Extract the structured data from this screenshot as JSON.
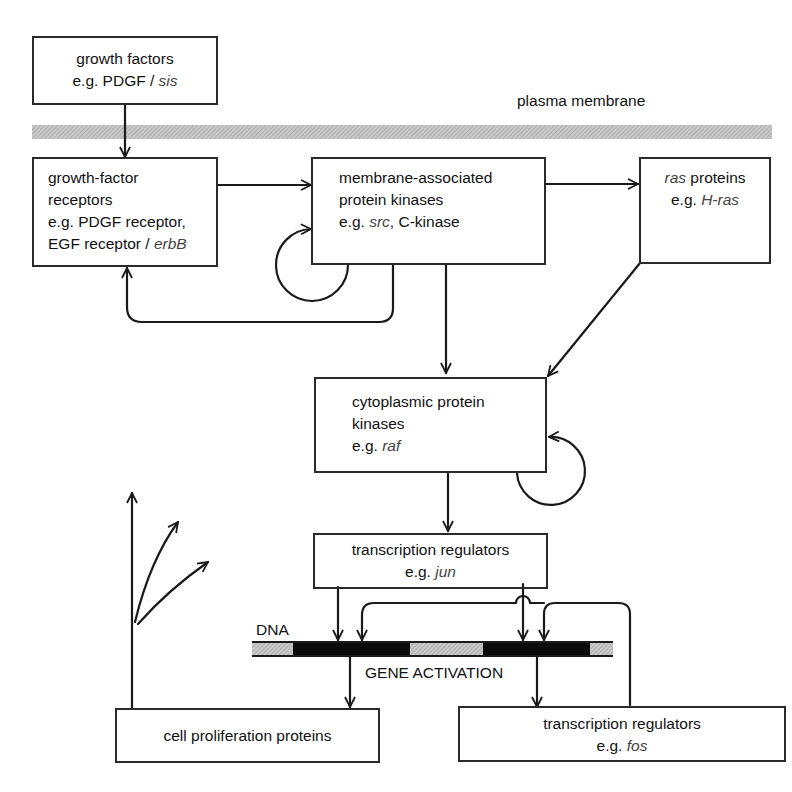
{
  "labels": {
    "membrane": "plasma membrane",
    "dna": "DNA",
    "gene_activation": "GENE ACTIVATION"
  },
  "nodes": {
    "growth_factors": {
      "line1": "growth factors",
      "prefix": "e.g. PDGF / ",
      "example": "sis"
    },
    "receptors": {
      "line1": "growth-factor",
      "line2": "receptors",
      "line3": "e.g. PDGF receptor,",
      "line4_prefix": "EGF receptor / ",
      "example": "erbB"
    },
    "membrane_kinases": {
      "line1": "membrane-associated",
      "line2": "protein kinases",
      "prefix": "e.g. ",
      "example": "src",
      "suffix": ", C-kinase"
    },
    "ras": {
      "example_head": "ras",
      "line1_rest": " proteins",
      "prefix": "e.g. ",
      "example": "H-ras"
    },
    "cyto_kinases": {
      "line1": "cytoplasmic protein",
      "line2": "kinases",
      "prefix": "e.g. ",
      "example": "raf"
    },
    "tr_jun": {
      "line1": "transcription regulators",
      "prefix": "e.g. ",
      "example": "jun"
    },
    "cell_prolif": {
      "line1": "cell proliferation proteins"
    },
    "tr_fos": {
      "line1": "transcription regulators",
      "prefix": "e.g. ",
      "example": "fos"
    }
  },
  "colors": {
    "stroke": "#1a1a1a",
    "membrane_band": "#b8b8b8",
    "dna_grey": "#c4c4c4",
    "dna_black": "#0a0a0a",
    "italic_text": "#444444"
  }
}
